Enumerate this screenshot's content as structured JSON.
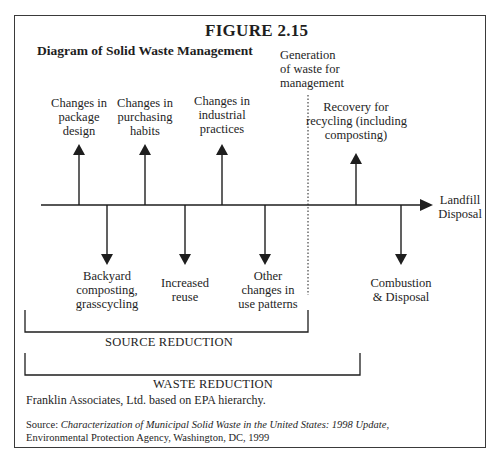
{
  "figure": {
    "number": "FIGURE 2.15",
    "title": "Diagram of Solid Waste Management"
  },
  "diagram": {
    "main_axis": {
      "end_label_line1": "Landfill",
      "end_label_line2": "Disposal"
    },
    "divider_label": [
      "Generation",
      "of waste for",
      "management"
    ],
    "upward_arrows": [
      {
        "label": [
          "Changes in",
          "package",
          "design"
        ]
      },
      {
        "label": [
          "Changes in",
          "purchasing",
          "habits"
        ]
      },
      {
        "label": [
          "Changes in",
          "industrial",
          "practices"
        ]
      },
      {
        "label": [
          "Recovery for",
          "recycling (including",
          "composting)"
        ]
      }
    ],
    "downward_arrows": [
      {
        "label": [
          "Backyard",
          "composting,",
          "grasscycling"
        ]
      },
      {
        "label": [
          "Increased",
          "reuse"
        ]
      },
      {
        "label": [
          "Other",
          "changes in",
          "use patterns"
        ]
      },
      {
        "label": [
          "Combustion",
          "& Disposal"
        ]
      }
    ],
    "brackets": {
      "source_reduction": "SOURCE REDUCTION",
      "waste_reduction": "WASTE REDUCTION"
    }
  },
  "footer": {
    "credit": "Franklin Associates, Ltd. based on EPA hierarchy.",
    "source_prefix": "Source: ",
    "source_title": "Characterization of Municipal Solid Waste in the United States: 1998 Update",
    "source_suffix": ",",
    "source_line2": "Environmental Protection Agency, Washington, DC, 1999"
  },
  "colors": {
    "ink": "#1e1e1e",
    "frame": "#3a3a3a",
    "background": "#ffffff"
  }
}
